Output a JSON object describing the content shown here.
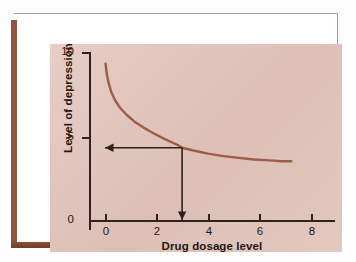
{
  "figure": {
    "background_color": "#e2c6bd",
    "card_color": "#ffffff",
    "shadow_color": "#8e5640",
    "axis_color": "#30211c",
    "curve_color": "#9c5c46",
    "annotation_color": "#30211c"
  },
  "chart_data": {
    "type": "line",
    "title": "",
    "xlabel": "Drug dosage level",
    "ylabel": "Level of depression",
    "xlim": [
      -0.75,
      8.75
    ],
    "ylim": [
      0,
      10
    ],
    "xticks": [
      0,
      2,
      4,
      6,
      8
    ],
    "xticklabels": [
      "0",
      "2",
      "4",
      "6",
      "8"
    ],
    "yticks": [
      0,
      5,
      10
    ],
    "yticklabels": [
      "0",
      "5",
      "10"
    ],
    "grid": false,
    "legend": null,
    "series": [
      {
        "name": "Depression vs dosage",
        "x": [
          0.02,
          0.08,
          0.15,
          0.25,
          0.4,
          0.6,
          0.85,
          1.15,
          1.5,
          1.9,
          2.35,
          2.85,
          3.0,
          3.4,
          4.0,
          4.6,
          5.2,
          5.8,
          6.4,
          6.9,
          7.25
        ],
        "y": [
          9.3,
          8.6,
          8.1,
          7.6,
          7.1,
          6.65,
          6.25,
          5.85,
          5.5,
          5.15,
          4.8,
          4.45,
          4.3,
          4.15,
          3.95,
          3.8,
          3.7,
          3.6,
          3.55,
          3.5,
          3.5
        ]
      }
    ],
    "annotations": [
      {
        "name": "dose-dropline",
        "kind": "arrow",
        "from": [
          3.0,
          4.3
        ],
        "to": [
          3.0,
          0.0
        ],
        "direction": "down"
      },
      {
        "name": "level-readoff",
        "kind": "arrow",
        "from": [
          3.0,
          4.3
        ],
        "to": [
          0.0,
          4.3
        ],
        "direction": "left"
      }
    ],
    "readoff": {
      "dosage": 3.0,
      "level": 4.3
    }
  }
}
